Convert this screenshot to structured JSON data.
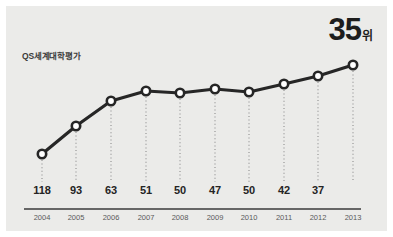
{
  "chart_data": {
    "type": "line",
    "title": "",
    "series_label": "QS세계대학평가",
    "xlabel": "",
    "ylabel": "",
    "grid": false,
    "legend_position": "inside-top-left",
    "y_inverted": true,
    "categories": [
      "2004",
      "2005",
      "2006",
      "2007",
      "2008",
      "2009",
      "2010",
      "2011",
      "2012",
      "2013"
    ],
    "values": [
      118,
      93,
      63,
      51,
      50,
      47,
      50,
      42,
      37,
      35
    ],
    "point_labels": [
      "118",
      "93",
      "63",
      "51",
      "50",
      "47",
      "50",
      "42",
      "37",
      ""
    ],
    "highlight": {
      "number": "35",
      "suffix": "위"
    },
    "annotations": [
      {
        "text": "QS세계대학평가",
        "kind": "series-label"
      }
    ]
  },
  "style": {
    "background": "#ebebe9",
    "line_color": "#262626",
    "marker_fill": "#ffffff",
    "marker_stroke": "#262626",
    "axis_color": "#3a3a3a",
    "leader_color": "#8d8d8d",
    "value_text_color": "#242424",
    "year_text_color": "#5a5a5a"
  },
  "geometry": {
    "points_x": [
      36,
      70,
      105,
      140,
      174,
      209,
      243,
      278,
      312,
      347
    ],
    "points_y": [
      148,
      120,
      95,
      85,
      87,
      83,
      86,
      78,
      70,
      59
    ],
    "leader_bottom": 176,
    "axis_y": 203,
    "axis_x1": 18,
    "axis_x2": 355,
    "value_label_y": 178,
    "year_label_y": 207
  }
}
